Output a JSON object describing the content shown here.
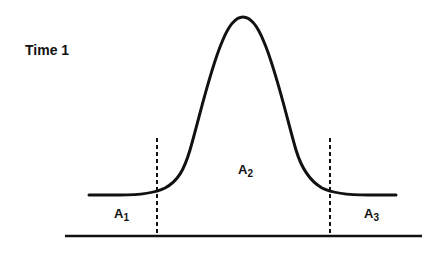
{
  "diagram": {
    "title": "Time 1",
    "curve_type": "bell-shaped distribution over baseline",
    "regions": [
      {
        "id": "A1",
        "letter": "A",
        "subscript": "1",
        "position": "left tail"
      },
      {
        "id": "A2",
        "letter": "A",
        "subscript": "2",
        "position": "center peak"
      },
      {
        "id": "A3",
        "letter": "A",
        "subscript": "3",
        "position": "right tail"
      }
    ],
    "dividers": [
      "dashed vertical line left of peak",
      "dashed vertical line right of peak"
    ],
    "colors": {
      "line": "#111111",
      "background": "#ffffff"
    }
  }
}
